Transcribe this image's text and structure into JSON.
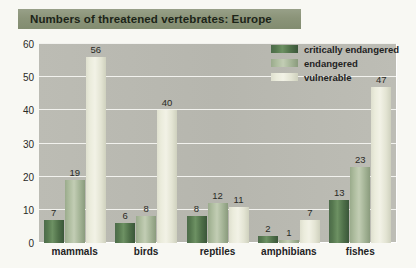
{
  "title": {
    "text": "Numbers of threatened vertebrates: Europe"
  },
  "colors": {
    "page_background": "#f8f8f3",
    "title_bar": "#8b9479",
    "plot_background": "#b8b8b0",
    "gridline": "#f2f2ee",
    "critically_endangered": "#4c6b4a",
    "endangered": "#a3b395",
    "vulnerable": "#e9eadb",
    "text": "#23231f"
  },
  "chart_data": {
    "type": "bar",
    "title": "Numbers of threatened vertebrates: Europe",
    "xlabel": "",
    "ylabel": "",
    "ylim": [
      0,
      60
    ],
    "yticks": [
      0,
      10,
      20,
      30,
      40,
      50,
      60
    ],
    "ytick_labels": [
      "0",
      "10",
      "20",
      "30",
      "40",
      "50",
      "60"
    ],
    "grid": true,
    "legend_position": "top-right",
    "categories": [
      "mammals",
      "birds",
      "reptiles",
      "amphibians",
      "fishes"
    ],
    "series": [
      {
        "name": "critically endangered",
        "color": "#4c6b4a",
        "values": [
          7,
          6,
          8,
          2,
          13
        ]
      },
      {
        "name": "endangered",
        "color": "#a3b395",
        "values": [
          19,
          8,
          12,
          1,
          23
        ]
      },
      {
        "name": "vulnerable",
        "color": "#e9eadb",
        "values": [
          56,
          40,
          11,
          7,
          47
        ]
      }
    ]
  }
}
